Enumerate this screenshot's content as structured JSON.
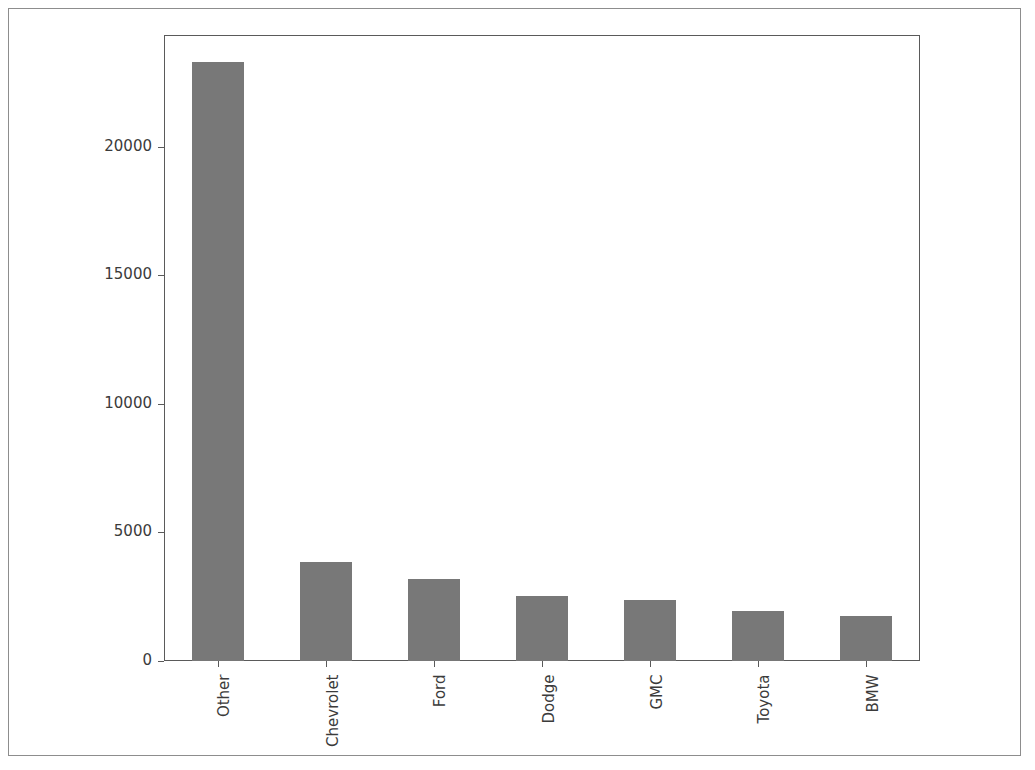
{
  "chart_data": {
    "type": "bar",
    "title": "",
    "subtitle": "",
    "xlabel": "",
    "ylabel": "",
    "categories": [
      "Other",
      "Chevrolet",
      "Ford",
      "Dodge",
      "GMC",
      "Toyota",
      "BMW"
    ],
    "values": [
      23300,
      3870,
      3200,
      2540,
      2380,
      1930,
      1740
    ],
    "series": [
      {
        "name": "count",
        "values": [
          23300,
          3870,
          3200,
          2540,
          2380,
          1930,
          1740
        ]
      }
    ],
    "ylim": [
      0,
      24350
    ],
    "xlim": [
      -0.5,
      6.5
    ],
    "yticks": [
      0,
      5000,
      10000,
      15000,
      20000
    ],
    "ytick_labels": [
      "0",
      "5000",
      "10000",
      "15000",
      "20000"
    ],
    "xtick_labels": [
      "Other",
      "Chevrolet",
      "Ford",
      "Dodge",
      "GMC",
      "Toyota",
      "BMW"
    ],
    "xtick_label_rotation": 90,
    "grid": false,
    "legend": false,
    "legend_position": "none",
    "bar_color": "#787878",
    "bar_width_ratio": 0.48,
    "axis_color": "#5a5a5a",
    "tick_label_color": "#3b3b3b",
    "background_color": "#ffffff",
    "border_color": "#8d8d8d"
  }
}
